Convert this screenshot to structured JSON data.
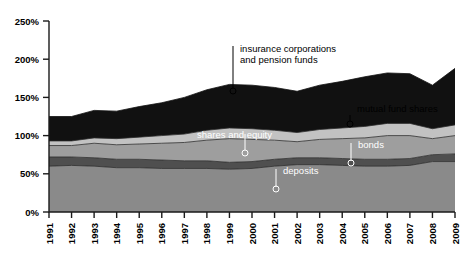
{
  "chart_data": {
    "type": "area",
    "stacked": true,
    "title": "",
    "subtitle": "",
    "xlabel": "",
    "ylabel": "",
    "grid": false,
    "legend_position": "inline-annotations",
    "ylim": [
      0,
      250
    ],
    "y_ticks": [
      0,
      50,
      100,
      150,
      200,
      250
    ],
    "y_tick_labels": [
      "0%",
      "50%",
      "100%",
      "150%",
      "200%",
      "250%"
    ],
    "x": [
      1991,
      1992,
      1993,
      1994,
      1995,
      1996,
      1997,
      1998,
      1999,
      2000,
      2001,
      2002,
      2003,
      2004,
      2005,
      2006,
      2007,
      2008,
      2009
    ],
    "x_tick_labels": [
      "1991",
      "1992",
      "1993",
      "1994",
      "1995",
      "1996",
      "1997",
      "1998",
      "1999",
      "2000",
      "2001",
      "2002",
      "2003",
      "2004",
      "2005",
      "2006",
      "2007",
      "2008",
      "2009"
    ],
    "series": [
      {
        "name": "deposits",
        "color": "#8a8a8a",
        "values": [
          60,
          61,
          60,
          58,
          58,
          57,
          57,
          57,
          56,
          57,
          60,
          62,
          62,
          61,
          60,
          60,
          61,
          66,
          66
        ]
      },
      {
        "name": "bonds",
        "color": "#4f4f4f",
        "values": [
          12,
          11,
          11,
          11,
          11,
          11,
          10,
          10,
          9,
          9,
          9,
          9,
          9,
          9,
          9,
          9,
          9,
          9,
          10
        ]
      },
      {
        "name": "shares and equity",
        "color": "#9e9e9e",
        "values": [
          15,
          15,
          19,
          19,
          20,
          22,
          24,
          27,
          31,
          29,
          25,
          21,
          24,
          26,
          28,
          31,
          30,
          21,
          24
        ]
      },
      {
        "name": "mutual fund shares",
        "color": "#c2c2c2",
        "values": [
          6,
          6,
          7,
          8,
          9,
          10,
          11,
          13,
          14,
          14,
          13,
          12,
          13,
          14,
          15,
          16,
          16,
          13,
          14
        ]
      },
      {
        "name": "insurance corporations and pension funds",
        "color": "#111111",
        "values": [
          32,
          32,
          36,
          36,
          40,
          43,
          48,
          53,
          57,
          57,
          56,
          54,
          58,
          61,
          65,
          66,
          65,
          57,
          74
        ]
      }
    ],
    "annotations": [
      {
        "id": "insurance-corporations-and-pension-funds",
        "lines": [
          "insurance corporations",
          "and pension funds"
        ],
        "text_color": "#000000",
        "text_x": 240,
        "text_y": 52,
        "line_x": 233,
        "line_y1": 46,
        "line_y2": 88,
        "dot_x": 233,
        "dot_y": 91
      },
      {
        "id": "mutual-fund-shares",
        "lines": [
          "mutual fund shares"
        ],
        "text_color": "#000000",
        "text_x": 357,
        "text_y": 112,
        "line_x": 350,
        "line_y1": 115,
        "line_y2": 121,
        "dot_x": 350,
        "dot_y": 124
      },
      {
        "id": "shares-and-equity",
        "lines": [
          "shares and equity"
        ],
        "text_color": "#ffffff",
        "text_x": 197,
        "text_y": 138,
        "line_x": 245,
        "line_y1": 134,
        "line_y2": 150,
        "dot_x": 245,
        "dot_y": 153
      },
      {
        "id": "bonds",
        "lines": [
          "bonds"
        ],
        "text_color": "#ffffff",
        "text_x": 358,
        "text_y": 148,
        "line_x": 351,
        "line_y1": 143,
        "line_y2": 161,
        "dot_x": 351,
        "dot_y": 163
      },
      {
        "id": "deposits",
        "lines": [
          "deposits"
        ],
        "text_color": "#ffffff",
        "text_x": 283,
        "text_y": 174,
        "line_x": 276,
        "line_y1": 169,
        "line_y2": 187,
        "dot_x": 276,
        "dot_y": 189
      }
    ],
    "colors": {
      "axis": "#1a1a1a",
      "background": "#ffffff",
      "boundary_line": "#2b2b2b"
    }
  }
}
